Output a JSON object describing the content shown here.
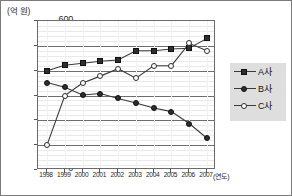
{
  "axes": {
    "y_unit_label": "(억 원)",
    "x_unit_label": "(연도)",
    "y_ticks": [
      600,
      500,
      400,
      300,
      200,
      100,
      0
    ],
    "y_min": 0,
    "y_max": 600,
    "x_ticks": [
      "1998",
      "1999",
      "2000",
      "2001",
      "2002",
      "2003",
      "2004",
      "2005",
      "2006",
      "2007"
    ]
  },
  "legend": {
    "position": "right",
    "items": [
      {
        "label": "A사",
        "marker": "filled-square",
        "color": "#2e2e2e"
      },
      {
        "label": "B사",
        "marker": "filled-circle",
        "color": "#2e2e2e"
      },
      {
        "label": "C사",
        "marker": "open-circle",
        "color": "#ffffff"
      }
    ]
  },
  "chart_data": {
    "type": "line",
    "title": "",
    "subtitle": "",
    "xlabel": "(연도)",
    "ylabel": "(억 원)",
    "ylim": [
      0,
      600
    ],
    "ytick_step": 100,
    "grid": true,
    "minor_grid": true,
    "legend_position": "right",
    "categories": [
      "1998",
      "1999",
      "2000",
      "2001",
      "2002",
      "2003",
      "2004",
      "2005",
      "2006",
      "2007"
    ],
    "series": [
      {
        "name": "A사",
        "marker": "filled-square",
        "values": [
          400,
          422,
          430,
          438,
          443,
          480,
          480,
          487,
          490,
          530
        ]
      },
      {
        "name": "B사",
        "marker": "filled-circle",
        "values": [
          352,
          333,
          302,
          308,
          288,
          270,
          250,
          235,
          187,
          128
        ]
      },
      {
        "name": "C사",
        "marker": "open-circle",
        "values": [
          100,
          300,
          350,
          378,
          408,
          370,
          420,
          420,
          510,
          480
        ]
      }
    ],
    "annotations": []
  }
}
